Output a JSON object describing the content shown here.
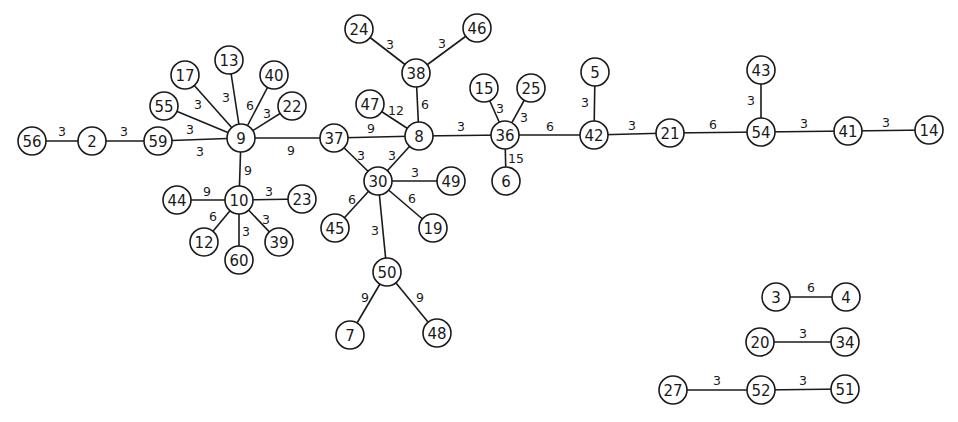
{
  "diagram": {
    "type": "weighted-undirected-graph",
    "node_radius": 14,
    "colors": {
      "stroke": "#1a1a1a",
      "background": "#ffffff"
    },
    "nodes": [
      {
        "id": "56",
        "x": 32,
        "y": 141
      },
      {
        "id": "2",
        "x": 92,
        "y": 141
      },
      {
        "id": "59",
        "x": 158,
        "y": 141
      },
      {
        "id": "9",
        "x": 241,
        "y": 138
      },
      {
        "id": "55",
        "x": 164,
        "y": 106
      },
      {
        "id": "17",
        "x": 185,
        "y": 75
      },
      {
        "id": "13",
        "x": 229,
        "y": 60
      },
      {
        "id": "40",
        "x": 274,
        "y": 75
      },
      {
        "id": "22",
        "x": 292,
        "y": 106
      },
      {
        "id": "10",
        "x": 239,
        "y": 200
      },
      {
        "id": "44",
        "x": 177,
        "y": 200
      },
      {
        "id": "23",
        "x": 302,
        "y": 199
      },
      {
        "id": "12",
        "x": 204,
        "y": 242
      },
      {
        "id": "60",
        "x": 239,
        "y": 260
      },
      {
        "id": "39",
        "x": 279,
        "y": 242
      },
      {
        "id": "37",
        "x": 334,
        "y": 138
      },
      {
        "id": "8",
        "x": 419,
        "y": 136
      },
      {
        "id": "38",
        "x": 416,
        "y": 73
      },
      {
        "id": "24",
        "x": 359,
        "y": 29
      },
      {
        "id": "46",
        "x": 477,
        "y": 28
      },
      {
        "id": "47",
        "x": 370,
        "y": 104
      },
      {
        "id": "30",
        "x": 378,
        "y": 181
      },
      {
        "id": "49",
        "x": 451,
        "y": 181
      },
      {
        "id": "45",
        "x": 335,
        "y": 228
      },
      {
        "id": "19",
        "x": 433,
        "y": 228
      },
      {
        "id": "50",
        "x": 387,
        "y": 272
      },
      {
        "id": "7",
        "x": 350,
        "y": 335
      },
      {
        "id": "48",
        "x": 437,
        "y": 333
      },
      {
        "id": "36",
        "x": 505,
        "y": 135
      },
      {
        "id": "15",
        "x": 484,
        "y": 88
      },
      {
        "id": "25",
        "x": 531,
        "y": 88
      },
      {
        "id": "6",
        "x": 506,
        "y": 181
      },
      {
        "id": "42",
        "x": 594,
        "y": 135
      },
      {
        "id": "5",
        "x": 595,
        "y": 72
      },
      {
        "id": "21",
        "x": 670,
        "y": 133
      },
      {
        "id": "54",
        "x": 761,
        "y": 132
      },
      {
        "id": "43",
        "x": 761,
        "y": 70
      },
      {
        "id": "41",
        "x": 848,
        "y": 131
      },
      {
        "id": "14",
        "x": 929,
        "y": 130
      },
      {
        "id": "3",
        "x": 776,
        "y": 297
      },
      {
        "id": "4",
        "x": 846,
        "y": 297
      },
      {
        "id": "20",
        "x": 760,
        "y": 342
      },
      {
        "id": "34",
        "x": 845,
        "y": 342
      },
      {
        "id": "27",
        "x": 673,
        "y": 390
      },
      {
        "id": "52",
        "x": 761,
        "y": 390
      },
      {
        "id": "51",
        "x": 845,
        "y": 389
      }
    ],
    "edges": [
      {
        "from": "56",
        "to": "2",
        "weight": "3",
        "lx": 62,
        "ly": 131
      },
      {
        "from": "2",
        "to": "59",
        "weight": "3",
        "lx": 124,
        "ly": 131
      },
      {
        "from": "59",
        "to": "9",
        "weight": "3",
        "lx": 200,
        "ly": 151
      },
      {
        "from": "55",
        "to": "9",
        "weight": "3",
        "lx": 190,
        "ly": 129
      },
      {
        "from": "17",
        "to": "9",
        "weight": "3",
        "lx": 198,
        "ly": 104
      },
      {
        "from": "13",
        "to": "9",
        "weight": "3",
        "lx": 226,
        "ly": 97
      },
      {
        "from": "40",
        "to": "9",
        "weight": "6",
        "lx": 250,
        "ly": 105
      },
      {
        "from": "22",
        "to": "9",
        "weight": "3",
        "lx": 267,
        "ly": 113
      },
      {
        "from": "9",
        "to": "37",
        "weight": "9",
        "lx": 291,
        "ly": 150
      },
      {
        "from": "9",
        "to": "10",
        "weight": "9",
        "lx": 248,
        "ly": 170
      },
      {
        "from": "44",
        "to": "10",
        "weight": "9",
        "lx": 207,
        "ly": 191
      },
      {
        "from": "10",
        "to": "23",
        "weight": "3",
        "lx": 269,
        "ly": 191
      },
      {
        "from": "10",
        "to": "12",
        "weight": "6",
        "lx": 213,
        "ly": 216
      },
      {
        "from": "10",
        "to": "60",
        "weight": "3",
        "lx": 246,
        "ly": 231
      },
      {
        "from": "10",
        "to": "39",
        "weight": "3",
        "lx": 266,
        "ly": 219
      },
      {
        "from": "37",
        "to": "8",
        "weight": "9",
        "lx": 371,
        "ly": 128
      },
      {
        "from": "37",
        "to": "30",
        "weight": "3",
        "lx": 361,
        "ly": 155
      },
      {
        "from": "8",
        "to": "30",
        "weight": "3",
        "lx": 392,
        "ly": 155
      },
      {
        "from": "8",
        "to": "38",
        "weight": "6",
        "lx": 425,
        "ly": 104
      },
      {
        "from": "47",
        "to": "8",
        "weight": "12",
        "lx": 396,
        "ly": 110
      },
      {
        "from": "38",
        "to": "24",
        "weight": "3",
        "lx": 390,
        "ly": 44
      },
      {
        "from": "38",
        "to": "46",
        "weight": "3",
        "lx": 442,
        "ly": 43
      },
      {
        "from": "8",
        "to": "36",
        "weight": "3",
        "lx": 461,
        "ly": 126
      },
      {
        "from": "30",
        "to": "49",
        "weight": "3",
        "lx": 415,
        "ly": 172
      },
      {
        "from": "30",
        "to": "45",
        "weight": "6",
        "lx": 352,
        "ly": 199
      },
      {
        "from": "30",
        "to": "19",
        "weight": "6",
        "lx": 412,
        "ly": 198
      },
      {
        "from": "30",
        "to": "50",
        "weight": "3",
        "lx": 375,
        "ly": 230
      },
      {
        "from": "50",
        "to": "7",
        "weight": "9",
        "lx": 365,
        "ly": 297
      },
      {
        "from": "50",
        "to": "48",
        "weight": "9",
        "lx": 420,
        "ly": 297
      },
      {
        "from": "36",
        "to": "15",
        "weight": "3",
        "lx": 500,
        "ly": 108
      },
      {
        "from": "36",
        "to": "25",
        "weight": "3",
        "lx": 524,
        "ly": 117
      },
      {
        "from": "36",
        "to": "6",
        "weight": "15",
        "lx": 516,
        "ly": 158
      },
      {
        "from": "36",
        "to": "42",
        "weight": "6",
        "lx": 550,
        "ly": 126
      },
      {
        "from": "42",
        "to": "5",
        "weight": "3",
        "lx": 585,
        "ly": 102
      },
      {
        "from": "42",
        "to": "21",
        "weight": "3",
        "lx": 632,
        "ly": 125
      },
      {
        "from": "21",
        "to": "54",
        "weight": "6",
        "lx": 713,
        "ly": 124
      },
      {
        "from": "54",
        "to": "43",
        "weight": "3",
        "lx": 751,
        "ly": 100
      },
      {
        "from": "54",
        "to": "41",
        "weight": "3",
        "lx": 804,
        "ly": 123
      },
      {
        "from": "41",
        "to": "14",
        "weight": "3",
        "lx": 886,
        "ly": 122
      },
      {
        "from": "3",
        "to": "4",
        "weight": "6",
        "lx": 811,
        "ly": 287
      },
      {
        "from": "20",
        "to": "34",
        "weight": "3",
        "lx": 803,
        "ly": 333
      },
      {
        "from": "27",
        "to": "52",
        "weight": "3",
        "lx": 717,
        "ly": 380
      },
      {
        "from": "52",
        "to": "51",
        "weight": "3",
        "lx": 803,
        "ly": 380
      }
    ]
  }
}
